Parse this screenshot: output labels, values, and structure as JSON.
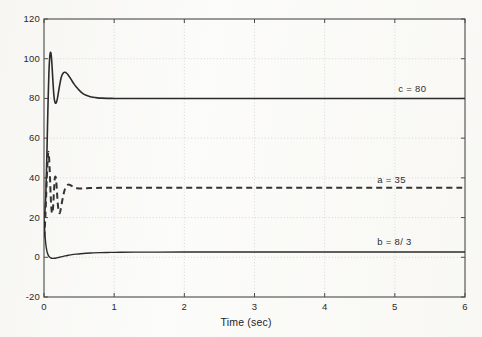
{
  "figure": {
    "background_color": "#fbfbf9",
    "axes_color": "#4a4a4a",
    "grid_color": "#c9c9c9"
  },
  "chart_data": {
    "type": "line",
    "title": "",
    "subtitle": "",
    "xlabel": "Time (sec)",
    "ylabel": "",
    "xlim": [
      0,
      6
    ],
    "ylim": [
      -20,
      120
    ],
    "xticks": [
      0,
      1,
      2,
      3,
      4,
      5,
      6
    ],
    "yticks": [
      -20,
      0,
      20,
      40,
      60,
      80,
      100,
      120
    ],
    "xtick_labels": [
      "0",
      "1",
      "2",
      "3",
      "4",
      "5",
      "6"
    ],
    "ytick_labels": [
      "-20",
      "0",
      "20",
      "40",
      "60",
      "80",
      "100",
      "120"
    ],
    "grid": true,
    "grid_style": "dotted",
    "legend_position": "inline-annotations",
    "annotations": [
      {
        "name": "c-annotation",
        "text": "c = 80",
        "x": 5.05,
        "y": 84.5
      },
      {
        "name": "a-annotation",
        "text": "a = 35",
        "x": 4.75,
        "y": 39.0
      },
      {
        "name": "b-annotation",
        "text": "b = 8/ 3",
        "x": 4.75,
        "y": 7.5
      }
    ],
    "series": [
      {
        "name": "c",
        "label": "c = 80",
        "steady_state": 80,
        "style": "solid",
        "color": "#2b2b2b",
        "width": 1.6,
        "x": [
          0.0,
          0.01,
          0.02,
          0.03,
          0.04,
          0.05,
          0.06,
          0.07,
          0.08,
          0.09,
          0.1,
          0.11,
          0.12,
          0.13,
          0.14,
          0.15,
          0.16,
          0.17,
          0.18,
          0.19,
          0.2,
          0.215,
          0.23,
          0.245,
          0.26,
          0.28,
          0.3,
          0.32,
          0.34,
          0.36,
          0.38,
          0.4,
          0.43,
          0.46,
          0.5,
          0.55,
          0.6,
          0.65,
          0.7,
          0.76,
          0.82,
          0.9,
          1.0,
          1.1,
          1.25,
          1.4,
          1.6,
          1.8,
          2.0,
          2.5,
          3.0,
          3.5,
          4.0,
          4.5,
          5.0,
          5.5,
          6.0
        ],
        "y": [
          20.0,
          22.0,
          27.0,
          36.0,
          50.0,
          66.0,
          81.0,
          93.0,
          100.0,
          103.0,
          102.5,
          99.0,
          93.0,
          87.0,
          82.0,
          79.0,
          77.8,
          77.6,
          78.3,
          79.8,
          81.8,
          85.0,
          88.0,
          90.5,
          92.0,
          93.0,
          93.2,
          92.8,
          92.0,
          91.0,
          90.0,
          88.8,
          87.2,
          85.8,
          84.2,
          82.6,
          81.6,
          81.0,
          80.6,
          80.3,
          80.15,
          80.05,
          80.0,
          80.0,
          80.0,
          80.0,
          80.0,
          80.0,
          80.0,
          80.0,
          80.0,
          80.0,
          80.0,
          80.0,
          80.0,
          80.0,
          80.0
        ]
      },
      {
        "name": "a",
        "label": "a = 35",
        "steady_state": 35,
        "style": "dashed",
        "color": "#333333",
        "width": 2.0,
        "x": [
          0.0,
          0.01,
          0.02,
          0.03,
          0.04,
          0.05,
          0.058,
          0.065,
          0.072,
          0.08,
          0.088,
          0.095,
          0.103,
          0.11,
          0.118,
          0.125,
          0.133,
          0.14,
          0.148,
          0.155,
          0.165,
          0.175,
          0.185,
          0.195,
          0.21,
          0.225,
          0.24,
          0.26,
          0.28,
          0.3,
          0.32,
          0.345,
          0.37,
          0.4,
          0.43,
          0.47,
          0.52,
          0.58,
          0.65,
          0.74,
          0.85,
          1.0,
          1.2,
          1.5,
          2.0,
          2.5,
          3.0,
          3.5,
          4.0,
          4.5,
          5.0,
          5.5,
          6.0
        ],
        "y": [
          10.0,
          14.0,
          21.0,
          30.0,
          40.0,
          48.0,
          52.0,
          53.0,
          50.5,
          45.0,
          38.0,
          31.0,
          26.0,
          23.0,
          22.2,
          23.5,
          27.0,
          32.0,
          37.0,
          40.0,
          40.5,
          38.0,
          33.0,
          27.5,
          23.2,
          22.3,
          24.5,
          28.5,
          32.0,
          34.5,
          36.0,
          36.6,
          36.4,
          35.8,
          35.3,
          34.8,
          34.6,
          34.7,
          34.85,
          34.95,
          35.0,
          35.0,
          35.0,
          35.0,
          35.0,
          35.0,
          35.0,
          35.0,
          35.0,
          35.0,
          35.0,
          35.0,
          35.0
        ]
      },
      {
        "name": "b",
        "label": "b = 8/ 3",
        "steady_state": 2.6667,
        "style": "solid",
        "color": "#2b2b2b",
        "width": 1.4,
        "x": [
          0.0,
          0.008,
          0.016,
          0.024,
          0.032,
          0.04,
          0.05,
          0.06,
          0.07,
          0.08,
          0.09,
          0.1,
          0.115,
          0.13,
          0.15,
          0.175,
          0.2,
          0.23,
          0.26,
          0.3,
          0.35,
          0.4,
          0.46,
          0.52,
          0.6,
          0.7,
          0.8,
          0.95,
          1.1,
          1.3,
          1.6,
          2.0,
          2.5,
          3.0,
          3.5,
          4.0,
          4.5,
          5.0,
          5.5,
          6.0
        ],
        "y": [
          20.0,
          15.0,
          10.5,
          7.2,
          5.0,
          3.4,
          2.0,
          1.1,
          0.5,
          0.1,
          -0.15,
          -0.35,
          -0.5,
          -0.55,
          -0.5,
          -0.35,
          -0.15,
          0.1,
          0.35,
          0.7,
          1.05,
          1.35,
          1.6,
          1.8,
          2.0,
          2.2,
          2.33,
          2.45,
          2.52,
          2.58,
          2.62,
          2.65,
          2.66,
          2.665,
          2.667,
          2.667,
          2.667,
          2.667,
          2.667,
          2.667
        ]
      }
    ]
  }
}
